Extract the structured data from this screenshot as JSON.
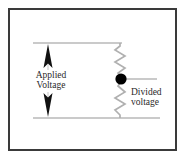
{
  "figure": {
    "background_color": "#ffffff",
    "frame_color": "#3a3a3a",
    "wire_color": "#b9b9b9",
    "resistor_color": "#b0b0b0",
    "node_color": "#000000",
    "arrow_color": "#1a1a1a",
    "text_color": "#2a2a2a"
  },
  "labels": {
    "applied": {
      "line1": "Applied",
      "line2": "Voltage"
    },
    "divided": {
      "line1": "Divided",
      "line2": "voltage"
    }
  },
  "circuit": {
    "top_rail": {
      "x1": 33,
      "y1": 43,
      "x2": 122,
      "y2": 43
    },
    "bottom_rail": {
      "x1": 33,
      "y1": 118,
      "x2": 160,
      "y2": 118
    },
    "output_lead": {
      "x1": 122,
      "y1": 79,
      "x2": 157,
      "y2": 79
    },
    "node_dot": {
      "cx": 121,
      "cy": 79,
      "r": 5.5
    },
    "resistor_top": {
      "x": 120,
      "y1": 43,
      "y2": 74,
      "amplitude": 5,
      "zigs": 4
    },
    "resistor_bottom": {
      "x": 120,
      "y1": 84,
      "y2": 118,
      "amplitude": 5,
      "zigs": 4
    },
    "arrow_up": {
      "x": 48,
      "y_tail": 70,
      "y_head": 45
    },
    "arrow_down": {
      "x": 48,
      "y_tail": 92,
      "y_head": 117
    }
  },
  "icons": {
    "node": "filled-circle-node-icon",
    "resistor": "zigzag-resistor-icon",
    "arrow_up": "arrow-up-icon",
    "arrow_down": "arrow-down-icon"
  }
}
